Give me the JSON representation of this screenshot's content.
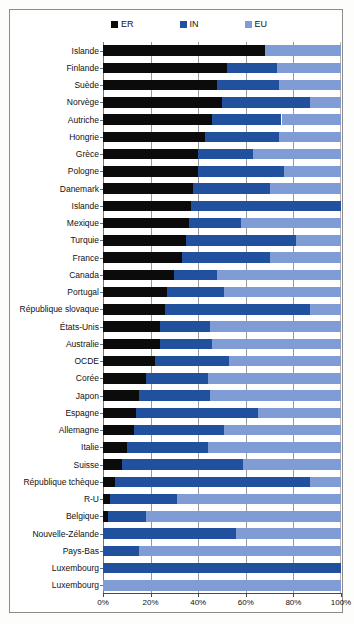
{
  "legend": {
    "items": [
      {
        "label": "ER",
        "color": "#0b0b0b"
      },
      {
        "label": "IN",
        "color": "#20509e"
      },
      {
        "label": "EU",
        "color": "#7f9cd4"
      }
    ]
  },
  "axis": {
    "x_ticks": [
      "0%",
      "20%",
      "40%",
      "60%",
      "80%",
      "100%"
    ],
    "x_tick_values": [
      0,
      20,
      40,
      60,
      80,
      100
    ]
  },
  "chart_data": {
    "type": "bar",
    "orientation": "horizontal",
    "stacked": true,
    "title": "",
    "subtitle": "",
    "xlabel": "",
    "ylabel": "",
    "xlim": [
      0,
      100
    ],
    "grid": true,
    "legend_position": "top-center",
    "legend": [
      "ER",
      "IN",
      "EU"
    ],
    "series": [
      {
        "name": "ER",
        "color": "#0b0b0b",
        "values": [
          68,
          52,
          48,
          50,
          46,
          43,
          40,
          40,
          38,
          37,
          36,
          35,
          33,
          30,
          27,
          26,
          24,
          24,
          22,
          18,
          15,
          14,
          13,
          10,
          8,
          5,
          3,
          2,
          0,
          0,
          0,
          0
        ]
      },
      {
        "name": "IN",
        "color": "#20509e",
        "values": [
          0,
          21,
          26,
          37,
          29,
          31,
          23,
          36,
          32,
          63,
          22,
          46,
          37,
          18,
          24,
          61,
          21,
          22,
          31,
          26,
          30,
          51,
          38,
          34,
          51,
          82,
          28,
          16,
          56,
          15,
          100,
          0
        ]
      },
      {
        "name": "EU",
        "color": "#7f9cd4",
        "values": [
          32,
          27,
          26,
          13,
          25,
          26,
          37,
          24,
          30,
          0,
          42,
          19,
          30,
          52,
          49,
          13,
          55,
          54,
          47,
          56,
          55,
          35,
          49,
          56,
          41,
          13,
          69,
          82,
          44,
          85,
          0,
          100
        ]
      }
    ],
    "categories": [
      "Islande",
      "Finlande",
      "Suède",
      "Norvège",
      "Autriche",
      "Hongrie",
      "Grèce",
      "Pologne",
      "Danemark",
      "Islande",
      "Mexique",
      "Turquie",
      "France",
      "Canada",
      "Portugal",
      "République slovaque",
      "États-Unis",
      "Australie",
      "OCDE",
      "Corée",
      "Japon",
      "Espagne",
      "Allemagne",
      "Italie",
      "Suisse",
      "République tchèque",
      "R-U",
      "Belgique",
      "Nouvelle-Zélande",
      "Pays-Bas",
      "Luxembourg",
      "Luxembourg"
    ]
  }
}
